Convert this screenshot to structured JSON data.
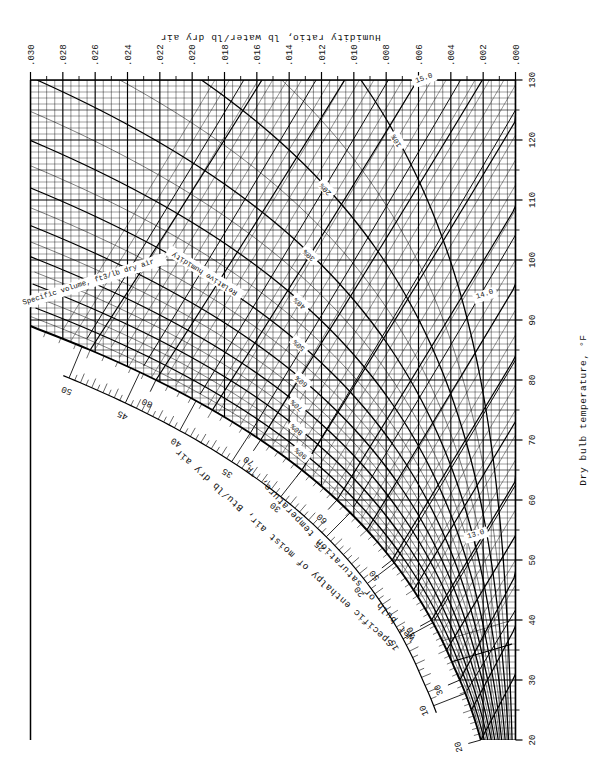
{
  "chart_title": "Psychrometric Chart",
  "axes": {
    "dry_bulb": {
      "label": "Dry bulb temperature, °F",
      "min": 20,
      "max": 130,
      "step": 10,
      "minor_step": 5,
      "ticks": [
        "20",
        "30",
        "40",
        "50",
        "60",
        "70",
        "80",
        "90",
        "100",
        "110",
        "120",
        "130"
      ]
    },
    "humidity_ratio": {
      "label": "Humidity ratio, lb water/lb dry air",
      "min": 0.0,
      "max": 0.03,
      "step": 0.002,
      "ticks": [
        ".000",
        ".002",
        ".004",
        ".006",
        ".008",
        ".010",
        ".012",
        ".014",
        ".016",
        ".018",
        ".020",
        ".022",
        ".024",
        ".026",
        ".028",
        ".030"
      ]
    },
    "enthalpy": {
      "label": "Specific enthalpy of moist air, Btu/lb dry air",
      "min": 10,
      "max": 50,
      "step": 5,
      "ticks": [
        "10",
        "15",
        "20",
        "25",
        "30",
        "35",
        "40",
        "45",
        "50"
      ]
    },
    "wet_bulb": {
      "label": "Wet bulb or saturation temperature, °F",
      "min": 20,
      "max": 85,
      "step": 10,
      "ticks": [
        "20",
        "30",
        "40",
        "50",
        "60",
        "70",
        "80"
      ]
    }
  },
  "families": {
    "relative_humidity": {
      "label": "Relative humidity",
      "values": [
        "10%",
        "20%",
        "30%",
        "40%",
        "50%",
        "60%",
        "70%",
        "80%",
        "90%"
      ]
    },
    "specific_volume": {
      "label": "Specific volume, ft3/lb dry air",
      "values": [
        "13.0",
        "14.0",
        "15.0"
      ]
    }
  },
  "chart_data": {
    "type": "line",
    "xlabel": "Dry bulb temperature, °F",
    "ylabel": "Humidity ratio, lb water/lb dry air",
    "xlim": [
      20,
      130
    ],
    "ylim": [
      0.0,
      0.03
    ],
    "grid": true,
    "legend": "inline-curve-labels",
    "series": [
      {
        "name": "Saturation (100% RH)",
        "unit": "W vs Tdb",
        "x": [
          20,
          25,
          30,
          35,
          40,
          45,
          50,
          55,
          60,
          65,
          70,
          75,
          80,
          85,
          90
        ],
        "values": [
          0.00216,
          0.00275,
          0.00346,
          0.00434,
          0.00528,
          0.0064,
          0.00772,
          0.00927,
          0.01108,
          0.01322,
          0.01578,
          0.01882,
          0.02233,
          0.02645,
          0.0312
        ]
      },
      {
        "name": "90% RH",
        "x": [
          20,
          30,
          40,
          50,
          60,
          70,
          80,
          90
        ],
        "values": [
          0.00194,
          0.00311,
          0.00475,
          0.00695,
          0.00997,
          0.0142,
          0.0201,
          0.0281
        ]
      },
      {
        "name": "80% RH",
        "x": [
          20,
          30,
          40,
          50,
          60,
          70,
          80,
          90
        ],
        "values": [
          0.00173,
          0.00277,
          0.00422,
          0.00618,
          0.00886,
          0.01262,
          0.01786,
          0.025
        ]
      },
      {
        "name": "70% RH",
        "x": [
          20,
          30,
          40,
          50,
          60,
          70,
          80,
          90
        ],
        "values": [
          0.00151,
          0.00242,
          0.0037,
          0.0054,
          0.00776,
          0.01105,
          0.01563,
          0.0219
        ]
      },
      {
        "name": "60% RH",
        "x": [
          20,
          30,
          40,
          50,
          60,
          70,
          80,
          90
        ],
        "values": [
          0.0013,
          0.00208,
          0.00317,
          0.00463,
          0.00665,
          0.00947,
          0.0134,
          0.01875
        ]
      },
      {
        "name": "50% RH",
        "x": [
          20,
          30,
          40,
          50,
          60,
          70,
          80,
          90,
          100
        ],
        "values": [
          0.00108,
          0.00173,
          0.00264,
          0.00386,
          0.00554,
          0.00789,
          0.01117,
          0.01562,
          0.0217
        ]
      },
      {
        "name": "40% RH",
        "x": [
          20,
          30,
          40,
          50,
          60,
          70,
          80,
          90,
          100,
          110
        ],
        "values": [
          0.00086,
          0.00139,
          0.00211,
          0.00309,
          0.00443,
          0.00631,
          0.00893,
          0.0125,
          0.01735,
          0.0239
        ]
      },
      {
        "name": "30% RH",
        "x": [
          20,
          30,
          40,
          50,
          60,
          70,
          80,
          90,
          100,
          110,
          120
        ],
        "values": [
          0.00065,
          0.00104,
          0.00158,
          0.00232,
          0.00333,
          0.00473,
          0.0067,
          0.00937,
          0.01301,
          0.01792,
          0.0245
        ]
      },
      {
        "name": "20% RH",
        "x": [
          20,
          40,
          60,
          80,
          100,
          120,
          130
        ],
        "values": [
          0.00043,
          0.00106,
          0.00222,
          0.00447,
          0.00868,
          0.01195,
          0.014
        ]
      },
      {
        "name": "10% RH",
        "x": [
          20,
          40,
          60,
          80,
          100,
          120,
          130
        ],
        "values": [
          0.00022,
          0.00053,
          0.00111,
          0.00223,
          0.00434,
          0.00598,
          0.007
        ]
      }
    ],
    "enthalpy_lines_btu": [
      10,
      15,
      20,
      25,
      30,
      35,
      40,
      45,
      50
    ],
    "wet_bulb_lines_F": [
      20,
      25,
      30,
      35,
      40,
      45,
      50,
      55,
      60,
      65,
      70,
      75,
      80,
      85
    ],
    "specific_volume_lines_ft3_lb": [
      12.5,
      13.0,
      13.5,
      14.0,
      14.5,
      15.0
    ]
  }
}
